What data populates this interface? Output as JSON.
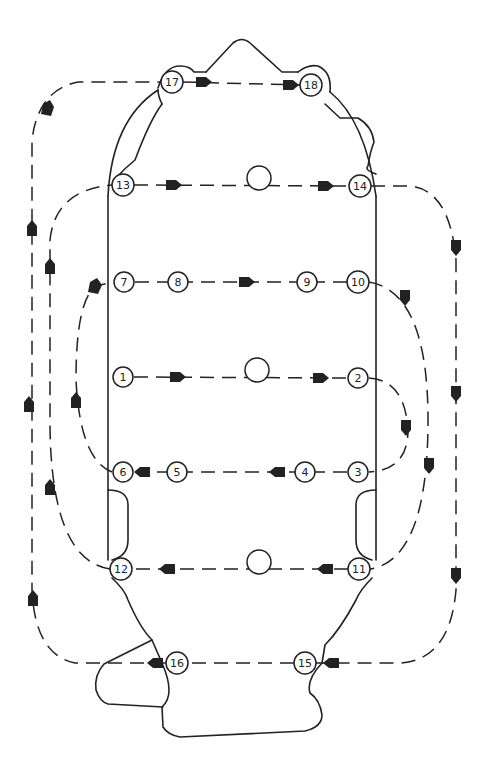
{
  "diagram": {
    "type": "tightening-sequence",
    "colors": {
      "line": "#222222",
      "background": "#ffffff"
    },
    "bolts": [
      {
        "id": "1",
        "label": "1",
        "x": 123,
        "y": 377
      },
      {
        "id": "2",
        "label": "2",
        "x": 358,
        "y": 378
      },
      {
        "id": "3",
        "label": "3",
        "x": 358,
        "y": 472
      },
      {
        "id": "4",
        "label": "4",
        "x": 305,
        "y": 472
      },
      {
        "id": "5",
        "label": "5",
        "x": 177,
        "y": 472
      },
      {
        "id": "6",
        "label": "6",
        "x": 123,
        "y": 472
      },
      {
        "id": "7",
        "label": "7",
        "x": 124,
        "y": 282
      },
      {
        "id": "8",
        "label": "8",
        "x": 178,
        "y": 282
      },
      {
        "id": "9",
        "label": "9",
        "x": 307,
        "y": 282
      },
      {
        "id": "10",
        "label": "10",
        "x": 358,
        "y": 282
      },
      {
        "id": "11",
        "label": "11",
        "x": 359,
        "y": 569
      },
      {
        "id": "12",
        "label": "12",
        "x": 121,
        "y": 569
      },
      {
        "id": "13",
        "label": "13",
        "x": 123,
        "y": 185
      },
      {
        "id": "14",
        "label": "14",
        "x": 360,
        "y": 186
      },
      {
        "id": "15",
        "label": "15",
        "x": 305,
        "y": 663
      },
      {
        "id": "16",
        "label": "16",
        "x": 177,
        "y": 663
      },
      {
        "id": "17",
        "label": "17",
        "x": 172,
        "y": 82
      },
      {
        "id": "18",
        "label": "18",
        "x": 311,
        "y": 85
      }
    ],
    "sequence": [
      "1",
      "2",
      "3",
      "4",
      "5",
      "6",
      "7",
      "8",
      "9",
      "10",
      "11",
      "12",
      "13",
      "14",
      "15",
      "16",
      "17",
      "18"
    ],
    "holes": [
      {
        "x": 259,
        "y": 178
      },
      {
        "x": 257,
        "y": 370
      },
      {
        "x": 259,
        "y": 562
      }
    ]
  }
}
